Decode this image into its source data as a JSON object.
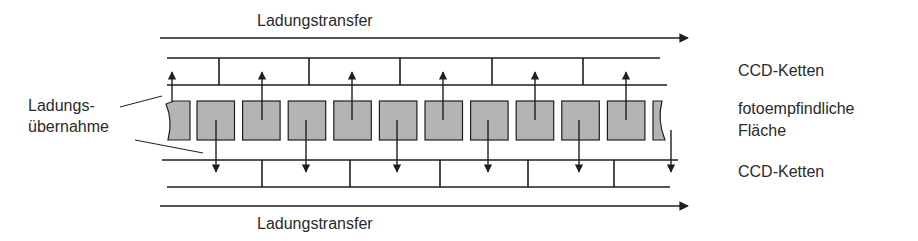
{
  "diagram": {
    "top_transfer_label": "Ladungstransfer",
    "bottom_transfer_label": "Ladungstransfer",
    "left_label_line1": "Ladungs-",
    "left_label_line2": "übernahme",
    "right_labels": {
      "top_ccd": "CCD-Ketten",
      "photosensitive_line1": "fotoempfindliche",
      "photosensitive_line2": "Fläche",
      "bottom_ccd": "CCD-Ketten"
    },
    "pixel_cell_count": 11,
    "pixel_cells_partial_ends": true,
    "transfer_direction": "right",
    "arrow_pattern": "alternating up/down per cell",
    "colors": {
      "line": "#1e1e1e",
      "cell_fill": "#b4b4b4",
      "text": "#2a2a2a"
    }
  }
}
